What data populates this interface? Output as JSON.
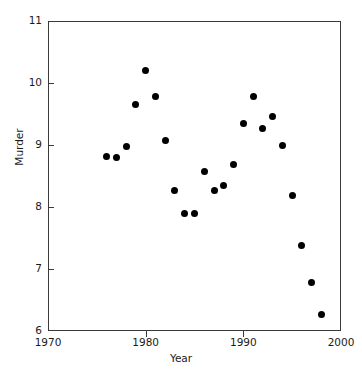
{
  "chart_data": {
    "type": "scatter",
    "title": "",
    "xlabel": "Year",
    "ylabel": "Murder",
    "xlim": [
      1970,
      2000
    ],
    "ylim": [
      6,
      11
    ],
    "xticks": [
      1970,
      1980,
      1990,
      2000
    ],
    "yticks": [
      6,
      7,
      8,
      9,
      10,
      11
    ],
    "xtick_labels": [
      "1970",
      "1980",
      "1990",
      "2000"
    ],
    "ytick_labels": [
      "6",
      "7",
      "8",
      "9",
      "10",
      "11"
    ],
    "grid": false,
    "legend": null,
    "marker": "filled-circle",
    "marker_color": "#000000",
    "x": [
      1976,
      1977,
      1978,
      1979,
      1980,
      1981,
      1982,
      1983,
      1984,
      1985,
      1986,
      1987,
      1988,
      1989,
      1990,
      1991,
      1992,
      1993,
      1994,
      1995,
      1996,
      1997,
      1998
    ],
    "y": [
      8.82,
      8.8,
      8.97,
      9.66,
      10.2,
      9.78,
      9.07,
      8.27,
      7.9,
      7.89,
      8.57,
      8.26,
      8.35,
      8.68,
      9.35,
      9.78,
      9.27,
      9.46,
      8.99,
      8.19,
      7.38,
      6.79,
      6.26
    ],
    "points": [
      {
        "x": 1976,
        "y": 8.82
      },
      {
        "x": 1977,
        "y": 8.8
      },
      {
        "x": 1978,
        "y": 8.97
      },
      {
        "x": 1979,
        "y": 9.66
      },
      {
        "x": 1980,
        "y": 10.2
      },
      {
        "x": 1981,
        "y": 9.78
      },
      {
        "x": 1982,
        "y": 9.07
      },
      {
        "x": 1983,
        "y": 8.27
      },
      {
        "x": 1984,
        "y": 7.9
      },
      {
        "x": 1985,
        "y": 7.89
      },
      {
        "x": 1986,
        "y": 8.57
      },
      {
        "x": 1987,
        "y": 8.26
      },
      {
        "x": 1988,
        "y": 8.35
      },
      {
        "x": 1989,
        "y": 8.68
      },
      {
        "x": 1990,
        "y": 9.35
      },
      {
        "x": 1991,
        "y": 9.78
      },
      {
        "x": 1992,
        "y": 9.27
      },
      {
        "x": 1993,
        "y": 9.46
      },
      {
        "x": 1994,
        "y": 8.99
      },
      {
        "x": 1995,
        "y": 8.19
      },
      {
        "x": 1996,
        "y": 7.38
      },
      {
        "x": 1997,
        "y": 6.79
      },
      {
        "x": 1998,
        "y": 6.26
      }
    ]
  }
}
